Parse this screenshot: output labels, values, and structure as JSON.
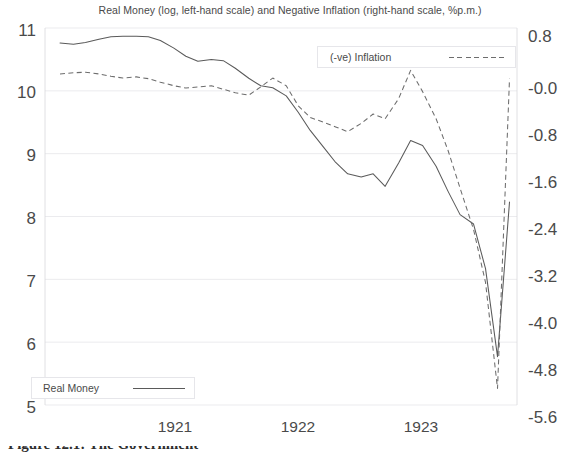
{
  "chart_data": {
    "type": "line",
    "title": "Real Money (log, left-hand scale) and Negative Inflation (right-hand scale, %p.m.)",
    "xlabel": "",
    "ylabel": "",
    "grid": true,
    "legend_position": "inside",
    "xlim": [
      1920.6,
      1923.75
    ],
    "xticks": [
      1921,
      1922,
      1923
    ],
    "xticklabels": [
      "1921",
      "1922",
      "1923"
    ],
    "left_axis": {
      "label": "Real Money (log)",
      "ylim": [
        5,
        11
      ],
      "ticks": [
        11,
        10,
        9,
        8,
        7,
        6,
        5
      ],
      "ticklabels": [
        "11",
        "10",
        "9",
        "8",
        "7",
        "6",
        "5"
      ]
    },
    "right_axis": {
      "label": "(-ve) Inflation (%p.m.)",
      "ylim": [
        -5.6,
        0.8
      ],
      "ticks": [
        0.8,
        -0.0,
        -0.8,
        -1.6,
        -2.4,
        -3.2,
        -4.0,
        -4.8,
        -5.6
      ],
      "ticklabels": [
        "0.8",
        "-0.0",
        "-0.8",
        "-1.6",
        "-2.4",
        "-3.2",
        "-4.0",
        "-4.8",
        "-5.6"
      ]
    },
    "series": [
      {
        "name": "Real Money",
        "axis": "left",
        "style": "solid",
        "color": "#5a5a5a",
        "x": [
          1920.7,
          1920.79,
          1920.87,
          1920.96,
          1921.04,
          1921.12,
          1921.21,
          1921.29,
          1921.37,
          1921.46,
          1921.54,
          1921.62,
          1921.71,
          1921.79,
          1921.87,
          1921.96,
          1922.04,
          1922.12,
          1922.21,
          1922.29,
          1922.37,
          1922.46,
          1922.54,
          1922.62,
          1922.71,
          1922.79,
          1922.87,
          1922.96,
          1923.04,
          1923.12,
          1923.21,
          1923.29,
          1923.37,
          1923.46,
          1923.54,
          1923.62,
          1923.7
        ],
        "y": [
          10.76,
          10.74,
          10.77,
          10.82,
          10.86,
          10.87,
          10.87,
          10.86,
          10.8,
          10.68,
          10.55,
          10.47,
          10.5,
          10.48,
          10.36,
          10.2,
          10.08,
          10.05,
          9.92,
          9.66,
          9.37,
          9.1,
          8.86,
          8.68,
          8.63,
          8.68,
          8.48,
          8.85,
          9.21,
          9.13,
          8.8,
          8.4,
          8.03,
          7.88,
          7.17,
          5.77,
          8.23
        ]
      },
      {
        "name": "(-ve) Inflation",
        "axis": "right",
        "style": "dashed",
        "color": "#6d6d6d",
        "x": [
          1920.7,
          1920.79,
          1920.87,
          1920.96,
          1921.04,
          1921.12,
          1921.21,
          1921.29,
          1921.37,
          1921.46,
          1921.54,
          1921.62,
          1921.71,
          1921.79,
          1921.87,
          1921.96,
          1922.04,
          1922.12,
          1922.21,
          1922.29,
          1922.37,
          1922.46,
          1922.54,
          1922.62,
          1922.71,
          1922.79,
          1922.87,
          1922.96,
          1923.04,
          1923.12,
          1923.21,
          1923.29,
          1923.37,
          1923.46,
          1923.54,
          1923.62,
          1923.7
        ],
        "y": [
          0.02,
          0.04,
          0.05,
          0.02,
          -0.02,
          -0.05,
          -0.03,
          -0.06,
          -0.12,
          -0.18,
          -0.22,
          -0.2,
          -0.18,
          -0.24,
          -0.3,
          -0.34,
          -0.2,
          -0.05,
          -0.18,
          -0.52,
          -0.72,
          -0.8,
          -0.88,
          -0.96,
          -0.82,
          -0.66,
          -0.74,
          -0.4,
          0.08,
          -0.28,
          -0.74,
          -1.28,
          -1.92,
          -2.62,
          -3.52,
          -5.32,
          -0.06
        ]
      }
    ],
    "annotations": []
  },
  "legends": {
    "inflation": {
      "label": "(-ve) Inflation"
    },
    "money": {
      "label": "Real Money"
    }
  },
  "caption": {
    "text": "Figure 12.1:  The Government"
  }
}
